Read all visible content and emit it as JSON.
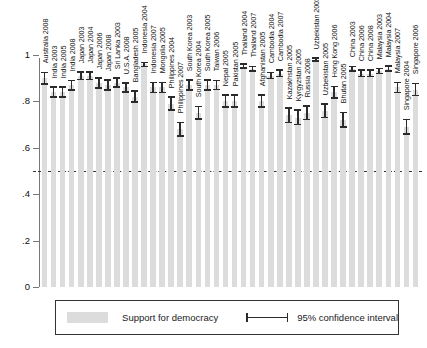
{
  "chart_data": {
    "type": "bar",
    "title": "",
    "subtitle": "",
    "xlabel": "",
    "ylabel": "",
    "ylim": [
      0,
      1
    ],
    "yticks": [
      "0",
      ".2",
      ".4",
      ".6",
      ".8",
      "1"
    ],
    "ytick_values": [
      0,
      0.2,
      0.4,
      0.6,
      0.8,
      1
    ],
    "grid": false,
    "reference_line": 0.5,
    "legend_position": "bottom",
    "bar_color": "#dcdcdc",
    "errorbar_color": "#2b2b2b",
    "series_name": "Support for democracy",
    "errorbar_name": "95% confidence interval",
    "categories": [
      "Australia 2008",
      "India 2003",
      "India 2005",
      "India 2008",
      "Japan 2003",
      "Japan 2004",
      "Japan 2006",
      "Japan 2008",
      "Sri Lanka 2003",
      "U.S.A. 2008",
      "Bangladesh 2005",
      "Indonesia 2004",
      "Indonesia 2007",
      "Mongolia 2005",
      "Philippines 2004",
      "Philippines 2007",
      "South Korea 2003",
      "South Korea 2004",
      "South Korea 2005",
      "Taiwan 2006",
      "Nepal 2005",
      "Pakistan 2005",
      "Thailand 2004",
      "Thailand 2007",
      "Afghanistan 2005",
      "Cambodia 2004",
      "Cambodia 2007",
      "Kazakhstan 2005",
      "Kyrgyzstan 2005",
      "Russia 2008",
      "Uzbekistan 2003",
      "Uzbekistan 2005",
      "Hong Kong 2006",
      "Bhutan 2005",
      "China 2003",
      "China 2006",
      "China 2008",
      "Malaysia 2003",
      "Malaysia 2004",
      "Malaysia 2007",
      "Singapore 2004",
      "Singapore 2006"
    ],
    "values": [
      0.9,
      0.84,
      0.84,
      0.87,
      0.91,
      0.91,
      0.88,
      0.87,
      0.88,
      0.86,
      0.82,
      0.96,
      0.86,
      0.86,
      0.79,
      0.68,
      0.87,
      0.75,
      0.87,
      0.87,
      0.8,
      0.8,
      0.95,
      0.94,
      0.8,
      0.91,
      0.92,
      0.74,
      0.73,
      0.75,
      0.98,
      0.76,
      0.84,
      0.72,
      0.94,
      0.92,
      0.92,
      0.93,
      0.94,
      0.86,
      0.69,
      0.85
    ],
    "ci_low": [
      0.875,
      0.82,
      0.82,
      0.85,
      0.895,
      0.895,
      0.858,
      0.85,
      0.862,
      0.84,
      0.798,
      0.95,
      0.838,
      0.838,
      0.763,
      0.65,
      0.848,
      0.725,
      0.85,
      0.852,
      0.775,
      0.775,
      0.945,
      0.932,
      0.775,
      0.898,
      0.908,
      0.71,
      0.7,
      0.722,
      0.975,
      0.73,
      0.815,
      0.69,
      0.932,
      0.908,
      0.908,
      0.92,
      0.93,
      0.838,
      0.66,
      0.825
    ],
    "ci_high": [
      0.925,
      0.862,
      0.862,
      0.89,
      0.928,
      0.928,
      0.9,
      0.892,
      0.9,
      0.88,
      0.845,
      0.968,
      0.882,
      0.882,
      0.818,
      0.71,
      0.892,
      0.778,
      0.892,
      0.89,
      0.828,
      0.828,
      0.962,
      0.95,
      0.828,
      0.925,
      0.935,
      0.772,
      0.762,
      0.78,
      0.988,
      0.79,
      0.865,
      0.752,
      0.95,
      0.935,
      0.935,
      0.942,
      0.952,
      0.882,
      0.722,
      0.878
    ]
  },
  "legend": {
    "bar_label": "Support for democracy",
    "ci_label": "95% confidence interval"
  }
}
